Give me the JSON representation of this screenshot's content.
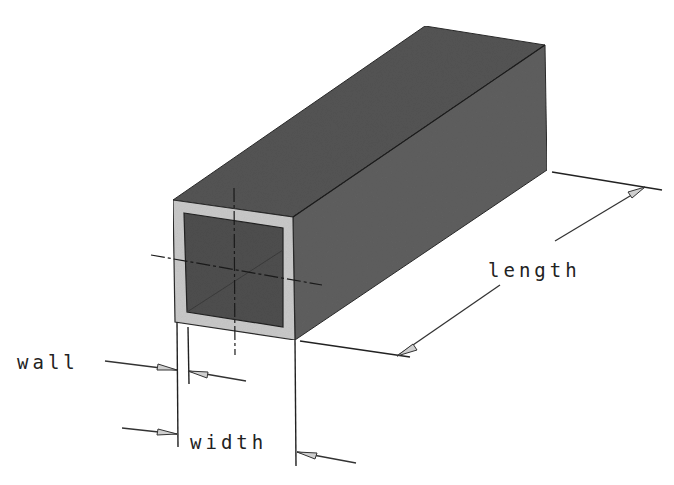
{
  "diagram": {
    "labels": {
      "length": "length",
      "wall": "wall",
      "width": "width"
    },
    "colors": {
      "top_face": "#545454",
      "side_face": "#5e5e5e",
      "front_wall": "#c8c8c8",
      "hollow_interior": "#4f4f4f",
      "lines": "#222222",
      "background": "#ffffff"
    }
  }
}
